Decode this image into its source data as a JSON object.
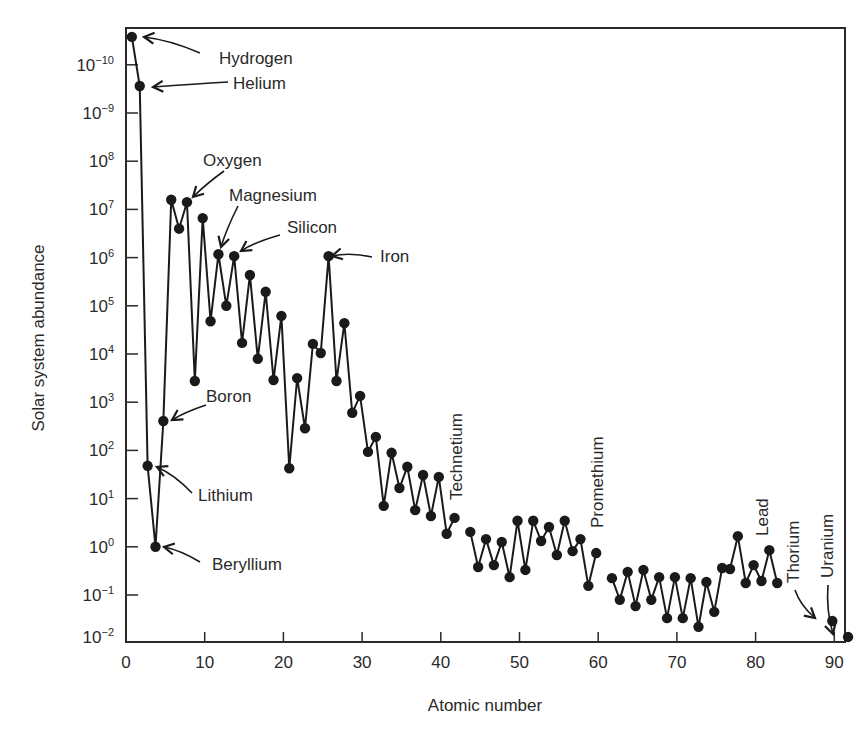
{
  "chart_data": {
    "type": "line",
    "title": "",
    "xlabel": "Atomic number",
    "ylabel": "Solar system abundance",
    "yscale": "log",
    "grid": false,
    "legend": null,
    "xlim": [
      0,
      93
    ],
    "ylim_log10": [
      -2,
      10.8
    ],
    "x_ticks": [
      0,
      10,
      20,
      30,
      40,
      50,
      60,
      70,
      80,
      90
    ],
    "y_tick_labels": [
      {
        "exp": 10,
        "label": "10",
        "sup": "−10"
      },
      {
        "exp": 9,
        "label": "10",
        "sup": "−9"
      },
      {
        "exp": 8,
        "label": "10",
        "sup": "8"
      },
      {
        "exp": 7,
        "label": "10",
        "sup": "7"
      },
      {
        "exp": 6,
        "label": "10",
        "sup": "6"
      },
      {
        "exp": 5,
        "label": "10",
        "sup": "5"
      },
      {
        "exp": 4,
        "label": "10",
        "sup": "4"
      },
      {
        "exp": 3,
        "label": "10",
        "sup": "3"
      },
      {
        "exp": 2,
        "label": "10",
        "sup": "2"
      },
      {
        "exp": 1,
        "label": "10",
        "sup": "1"
      },
      {
        "exp": 0,
        "label": "10",
        "sup": "0"
      },
      {
        "exp": -1,
        "label": "10",
        "sup": "−1"
      },
      {
        "exp": -2,
        "label": "10",
        "sup": "−2"
      }
    ],
    "series": [
      {
        "name": "Solar system abundance",
        "segments": [
          {
            "x": [
              1,
              2,
              3,
              4,
              5,
              6,
              7,
              8,
              9,
              10,
              11,
              12,
              13,
              14,
              15,
              16,
              17,
              18,
              19,
              20,
              21,
              22,
              23,
              24,
              25,
              26,
              27,
              28,
              29,
              30,
              31,
              32,
              33,
              34,
              35,
              36,
              37,
              38,
              39,
              40,
              41,
              42
            ],
            "log10_y": [
              10.58,
              9.56,
              1.68,
              0.0,
              2.61,
              7.2,
              6.6,
              7.15,
              3.44,
              6.82,
              4.68,
              6.07,
              5.0,
              6.03,
              4.23,
              5.64,
              3.9,
              5.29,
              3.46,
              4.79,
              1.63,
              3.5,
              2.46,
              4.21,
              4.02,
              6.03,
              3.44,
              4.64,
              2.78,
              3.13,
              1.97,
              2.28,
              0.85,
              1.95,
              1.22,
              1.66,
              0.76,
              1.49,
              0.64,
              1.45,
              0.27,
              0.6
            ]
          },
          {
            "x": [
              44,
              45,
              46,
              47,
              48,
              49,
              50,
              51,
              52,
              53,
              54,
              55,
              56,
              57,
              58,
              59,
              60
            ],
            "log10_y": [
              0.31,
              -0.42,
              0.16,
              -0.38,
              0.1,
              -0.63,
              0.54,
              -0.48,
              0.54,
              0.12,
              0.41,
              -0.17,
              0.54,
              -0.09,
              0.16,
              -0.81,
              -0.13
            ]
          },
          {
            "x": [
              62,
              63,
              64,
              65,
              66,
              67,
              68,
              69,
              70,
              71,
              72,
              73,
              74,
              75,
              76,
              77,
              78,
              79,
              80,
              81,
              82,
              83
            ],
            "log10_y": [
              -0.65,
              -1.1,
              -0.52,
              -1.23,
              -0.48,
              -1.1,
              -0.63,
              -1.48,
              -0.63,
              -1.48,
              -0.65,
              -1.66,
              -0.73,
              -1.35,
              -0.44,
              -0.46,
              0.22,
              -0.75,
              -0.38,
              -0.71,
              -0.07,
              -0.75
            ]
          },
          {
            "x": [
              90
            ],
            "log10_y": [
              -1.54
            ]
          },
          {
            "x": [
              92
            ],
            "log10_y": [
              -1.87
            ]
          }
        ]
      }
    ],
    "annotations": [
      {
        "text": "Hydrogen",
        "z": 1,
        "tx": 219,
        "ty": 64,
        "orient": "h",
        "arrow": [
          [
            200,
            53
          ],
          [
            170,
            40
          ],
          [
            144,
            37
          ]
        ]
      },
      {
        "text": "Helium",
        "z": 2,
        "tx": 233,
        "ty": 89,
        "orient": "h",
        "arrow": [
          [
            228,
            82
          ],
          [
            195,
            84
          ],
          [
            153,
            87
          ]
        ]
      },
      {
        "text": "Oxygen",
        "z": 8,
        "tx": 203,
        "ty": 166,
        "orient": "h",
        "arrow": [
          [
            224,
            171
          ],
          [
            206,
            184
          ],
          [
            193,
            197
          ]
        ]
      },
      {
        "text": "Magnesium",
        "z": 12,
        "tx": 229,
        "ty": 201,
        "orient": "h",
        "arrow": [
          [
            238,
            206
          ],
          [
            226,
            230
          ],
          [
            221,
            247
          ]
        ]
      },
      {
        "text": "Silicon",
        "z": 14,
        "tx": 287,
        "ty": 233,
        "orient": "h",
        "arrow": [
          [
            280,
            235
          ],
          [
            255,
            242
          ],
          [
            241,
            251
          ]
        ]
      },
      {
        "text": "Iron",
        "z": 26,
        "tx": 380,
        "ty": 262,
        "orient": "h",
        "arrow": [
          [
            372,
            257
          ],
          [
            350,
            252
          ],
          [
            332,
            256
          ]
        ]
      },
      {
        "text": "Boron",
        "z": 5,
        "tx": 206,
        "ty": 402,
        "orient": "h",
        "arrow": [
          [
            206,
            405
          ],
          [
            185,
            412
          ],
          [
            172,
            420
          ]
        ]
      },
      {
        "text": "Lithium",
        "z": 3,
        "tx": 198,
        "ty": 501,
        "orient": "h",
        "arrow": [
          [
            192,
            493
          ],
          [
            175,
            475
          ],
          [
            157,
            467
          ]
        ]
      },
      {
        "text": "Beryllium",
        "z": 4,
        "tx": 212,
        "ty": 570,
        "orient": "h",
        "arrow": [
          [
            200,
            562
          ],
          [
            180,
            550
          ],
          [
            164,
            547
          ]
        ]
      },
      {
        "text": "Technetium",
        "z": 43,
        "tx": 462,
        "ty": 500,
        "orient": "v",
        "arrow": null
      },
      {
        "text": "Promethium",
        "z": 61,
        "tx": 603,
        "ty": 528,
        "orient": "v",
        "arrow": null
      },
      {
        "text": "Lead",
        "z": 82,
        "tx": 768,
        "ty": 536,
        "orient": "v",
        "arrow": null
      },
      {
        "text": "Thorium",
        "z": 90,
        "tx": 799,
        "ty": 583,
        "orient": "v",
        "arrow": [
          [
            795,
            590
          ],
          [
            800,
            605
          ],
          [
            815,
            618
          ]
        ]
      },
      {
        "text": "Uranium",
        "z": 92,
        "tx": 833,
        "ty": 578,
        "orient": "v",
        "arrow": [
          [
            828,
            585
          ],
          [
            826,
            610
          ],
          [
            833,
            634
          ]
        ]
      }
    ]
  },
  "layout": {
    "plot": {
      "left": 126,
      "top": 28,
      "right": 845,
      "bottom": 642
    },
    "x_px_per_unit": 7.87,
    "y_px_at_log_minus1": 595,
    "y_px_per_decade": 48.2,
    "line_color": "#1a1a1a",
    "marker_color": "#1a1a1a",
    "axis_color": "#2a2a2a"
  }
}
